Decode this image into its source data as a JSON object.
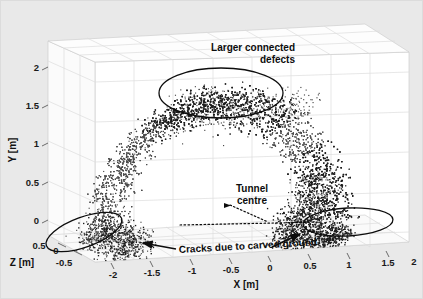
{
  "figure": {
    "title": "",
    "background_color": "#e9e9e9",
    "plot_background_color": "#ffffff",
    "grid_color": "#d8d8d8",
    "point_color": "#4a4a4a",
    "dense_point_color": "#1c1c1c",
    "annotation_color": "#0d0d0d"
  },
  "chart_data": {
    "type": "scatter",
    "title": "",
    "subtitle": "",
    "projection": "3d",
    "xlabel": "X [m]",
    "ylabel": "Y [m]",
    "zlabel": "Z [m]",
    "xlim": [
      -2.5,
      2.2
    ],
    "ylim": [
      -0.35,
      2.25
    ],
    "zlim": [
      -0.7,
      0.6
    ],
    "xticks": [
      -2,
      -1.5,
      -1,
      -0.5,
      0,
      0.5,
      1,
      1.5,
      2
    ],
    "xticklabels": [
      "-2",
      "-1.5",
      "-1",
      "-0.5",
      "0",
      "0.5",
      "1",
      "1.5",
      "2"
    ],
    "yticks": [
      0,
      0.5,
      1,
      1.5,
      2
    ],
    "yticklabels": [
      "0",
      "0.5",
      "1",
      "1.5",
      "2"
    ],
    "zticks": [
      0.5,
      0,
      -0.5
    ],
    "zticklabels": [
      "0.5",
      "0",
      "-0.5"
    ],
    "grid": true,
    "legend": false,
    "legend_position": "none",
    "series": [
      {
        "name": "defect points",
        "marker": "dot",
        "color": "#4a4a4a",
        "description": "Dense arch-shaped band of defect points spanning x from about -2.1 to 1.4 and y from about -0.2 to 1.8, peaking near x = -0.1, y = 1.75."
      }
    ],
    "annotations": [
      {
        "id": "larger-connected-defects",
        "text": "Larger connected\ndefects",
        "text_lines": [
          "Larger connected",
          "defects"
        ],
        "marker": "ellipse",
        "target": "top of arch",
        "ellipse_center": [
          -0.15,
          1.68
        ],
        "ellipse_size": [
          1.45,
          0.52
        ],
        "ellipse_rotation_deg": 0
      },
      {
        "id": "tunnel-centre",
        "text": "Tunnel\ncentre",
        "text_lines": [
          "Tunnel",
          "centre"
        ],
        "marker": "dotted-leader",
        "target": "tunnel axis centre point"
      },
      {
        "id": "cracks-due-to-carved-ground",
        "text": "Cracks due to carved ground",
        "text_lines": [
          "Cracks due to carved ground"
        ],
        "marker": "ellipse+arrow",
        "target": "both lower springline clusters",
        "ellipses": [
          {
            "center": [
              -1.85,
              -0.05
            ],
            "size": [
              1.1,
              0.42
            ],
            "rotation_deg": -22
          },
          {
            "center": [
              1.05,
              0.0
            ],
            "size": [
              1.25,
              0.38
            ],
            "rotation_deg": 0
          }
        ]
      }
    ]
  },
  "axes": {
    "x": {
      "label": "X [m]",
      "ticks": [
        {
          "v": -2,
          "label": "-2"
        },
        {
          "v": -1.5,
          "label": "-1.5"
        },
        {
          "v": -1,
          "label": "-1"
        },
        {
          "v": -0.5,
          "label": "-0.5"
        },
        {
          "v": 0,
          "label": "0"
        },
        {
          "v": 0.5,
          "label": "0.5"
        },
        {
          "v": 1,
          "label": "1"
        },
        {
          "v": 1.5,
          "label": "1.5"
        },
        {
          "v": 2,
          "label": "2"
        }
      ]
    },
    "y": {
      "label": "Y [m]",
      "ticks": [
        {
          "v": 2,
          "label": "2"
        },
        {
          "v": 1.5,
          "label": "1.5"
        },
        {
          "v": 1,
          "label": "1"
        },
        {
          "v": 0.5,
          "label": "0.5"
        },
        {
          "v": 0,
          "label": "0"
        }
      ]
    },
    "z": {
      "label": "Z [m]",
      "ticks": [
        {
          "v": 0.5,
          "label": "0.5"
        },
        {
          "v": 0,
          "label": "0"
        },
        {
          "v": -0.5,
          "label": "-0.5"
        }
      ]
    }
  },
  "labels": {
    "defects_line1": "Larger connected",
    "defects_line2": "defects",
    "tunnel_line1": "Tunnel",
    "tunnel_line2": "centre",
    "cracks": "Cracks due to carved ground"
  }
}
